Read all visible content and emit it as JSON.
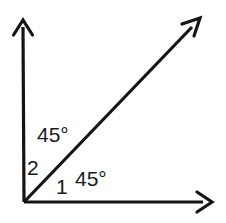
{
  "figure": {
    "background_color": "#ffffff",
    "stroke_color": "#141414",
    "text_color": "#1a1a1a",
    "width": 226,
    "height": 223
  },
  "vertex": {
    "name": "origin-vertex",
    "x": 24,
    "y": 202
  },
  "rays": [
    {
      "name": "vertical-ray",
      "from": {
        "x": 24,
        "y": 202
      },
      "to": {
        "x": 23,
        "y": 20
      },
      "direction": "up",
      "angle_degrees": 90,
      "stroke_width": 3
    },
    {
      "name": "diagonal-ray",
      "from": {
        "x": 24,
        "y": 202
      },
      "to": {
        "x": 200,
        "y": 19
      },
      "direction": "up-right",
      "angle_degrees": 45,
      "stroke_width": 3
    },
    {
      "name": "horizontal-ray",
      "from": {
        "x": 24,
        "y": 202
      },
      "to": {
        "x": 212,
        "y": 202
      },
      "direction": "right",
      "angle_degrees": 0,
      "stroke_width": 3
    }
  ],
  "labels": {
    "upper_angle_measure": "45°",
    "lower_angle_measure": "45°",
    "angle_two_name": "2",
    "angle_one_name": "1"
  },
  "annotations": {
    "angle_2_description": "angle between vertical ray and diagonal ray, measures 45 degrees",
    "angle_1_description": "angle between diagonal ray and horizontal ray, measures 45 degrees"
  }
}
